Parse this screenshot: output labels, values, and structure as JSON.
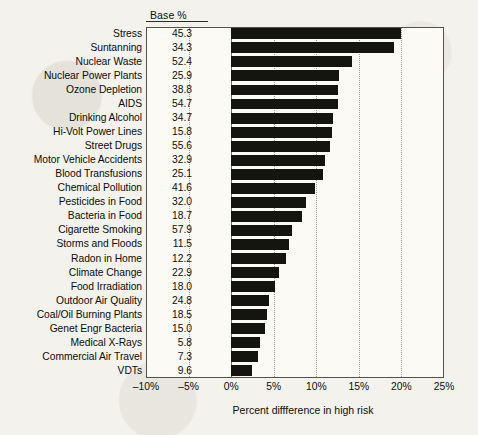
{
  "chart_data": {
    "type": "bar",
    "orientation": "horizontal",
    "title": "",
    "xlabel": "Percent diffference in high risk",
    "ylabel": "",
    "xlim": [
      -10,
      25
    ],
    "xticks": [
      -10,
      -5,
      0,
      5,
      10,
      15,
      20,
      25
    ],
    "xtick_labels": [
      "–10%",
      "–5%",
      "0%",
      "5%",
      "10%",
      "15%",
      "20%",
      "25%"
    ],
    "grid": "vertical-dotted",
    "legend": "none",
    "bar_color": "#151510",
    "categories": [
      "Stress",
      "Suntanning",
      "Nuclear Waste",
      "Nuclear Power Plants",
      "Ozone Depletion",
      "AIDS",
      "Drinking Alcohol",
      "Hi-Volt Power Lines",
      "Street Drugs",
      "Motor Vehicle Accidents",
      "Blood Transfusions",
      "Chemical Pollution",
      "Pesticides in Food",
      "Bacteria in Food",
      "Cigarette Smoking",
      "Storms and Floods",
      "Radon in Home",
      "Climate Change",
      "Food Irradiation",
      "Outdoor Air Quality",
      "Coal/Oil Burning Plants",
      "Genet Engr Bacteria",
      "Medical X-Rays",
      "Commercial Air Travel",
      "VDTs"
    ],
    "values": [
      20.0,
      19.1,
      14.2,
      12.7,
      12.5,
      12.5,
      12.0,
      11.9,
      11.6,
      11.0,
      10.8,
      9.8,
      8.8,
      8.3,
      7.1,
      6.8,
      6.4,
      5.6,
      5.2,
      4.5,
      4.2,
      4.0,
      3.4,
      3.2,
      2.5
    ],
    "base_percent_header": "Base %",
    "base_percent": [
      "45.3",
      "34.3",
      "52.4",
      "25.9",
      "38.8",
      "54.7",
      "34.7",
      "15.8",
      "55.6",
      "32.9",
      "25.1",
      "41.6",
      "32.0",
      "18.7",
      "57.9",
      "11.5",
      "12.2",
      "22.9",
      "18.0",
      "24.8",
      "18.5",
      "15.0",
      "5.8",
      "7.3",
      "9.6"
    ]
  }
}
